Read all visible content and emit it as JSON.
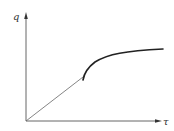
{
  "diagram": {
    "axes": {
      "y_label": "q",
      "x_label": "τ"
    },
    "colors": {
      "axis": "#555555",
      "line": "#666666",
      "curve": "#222222",
      "background": "#ffffff"
    },
    "points": {
      "origin": [
        26,
        121
      ],
      "y_axis_top": [
        26,
        14
      ],
      "x_axis_right": [
        162,
        121
      ],
      "kink": [
        83,
        77
      ],
      "curve_end": [
        163,
        49
      ]
    },
    "segments": [
      {
        "name": "linear-rise",
        "style": "thin",
        "description": "straight line from origin to kink point"
      },
      {
        "name": "saturation-curve",
        "style": "thick",
        "description": "concave curve rising from kink and leveling off toward a plateau"
      }
    ]
  }
}
